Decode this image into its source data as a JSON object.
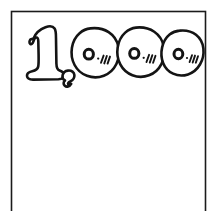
{
  "artwork": {
    "title": "1,000",
    "style": "hand-drawn bubble outline lettering",
    "description": "Hand-drawn number one thousand inside a thin rectangular frame",
    "ink_color": "#141414",
    "paper_color": "#ffffff",
    "frame_color": "#1b1b1b"
  },
  "frame": {
    "name": "page-border"
  },
  "number": {
    "full_text": "1,000",
    "digits": [
      {
        "glyph": "1",
        "name": "digit-one"
      },
      {
        "glyph": ",",
        "name": "comma"
      },
      {
        "glyph": "0",
        "name": "digit-zero-first"
      },
      {
        "glyph": "0",
        "name": "digit-zero-second"
      },
      {
        "glyph": "0",
        "name": "digit-zero-third"
      }
    ],
    "zero_decoration": {
      "center_hole": "o",
      "shine_marks": "///",
      "shine_dot": "."
    }
  }
}
